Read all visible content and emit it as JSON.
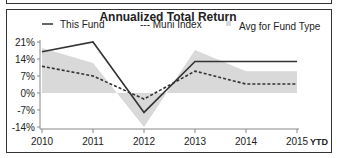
{
  "chart_data": {
    "type": "line",
    "title": "Annualized Total Return",
    "xlabel": "",
    "ylabel": "",
    "categories": [
      "2010",
      "2011",
      "2012",
      "2013",
      "2014",
      "2015"
    ],
    "x_suffix_label": "YTD",
    "yticks": [
      "21%",
      "14%",
      "7%",
      "0%",
      "-7%",
      "-14%"
    ],
    "ytick_values": [
      21,
      14,
      7,
      0,
      -7,
      -14
    ],
    "ylim": [
      -14,
      21
    ],
    "grid": false,
    "legend_position": "top",
    "series": [
      {
        "name": "This Fund",
        "style": "solid",
        "color": "#333333",
        "values": [
          17,
          21,
          -8,
          13,
          13,
          13
        ]
      },
      {
        "name": "Muni Index",
        "style": "dashed",
        "color": "#333333",
        "values": [
          11,
          7,
          -2.5,
          9,
          3.7,
          3.7
        ]
      },
      {
        "name": "Avg for Fund Type",
        "style": "band",
        "color": "#d9d9d9",
        "values": [
          18.5,
          12.4,
          -14,
          17.7,
          9,
          9
        ]
      }
    ],
    "legend": [
      {
        "label": "This Fund",
        "marker": "—"
      },
      {
        "label": "--- Muni Index",
        "marker": ""
      },
      {
        "label": "Avg for Fund Type",
        "marker": "■"
      }
    ]
  }
}
